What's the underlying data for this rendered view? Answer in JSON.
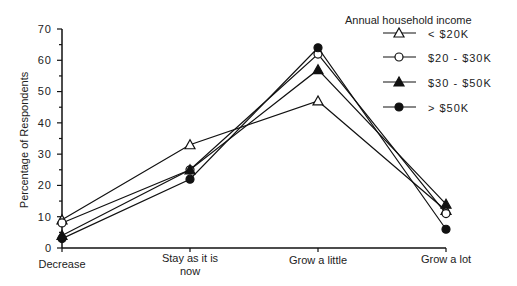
{
  "chart_data": {
    "type": "line",
    "title": "",
    "xlabel": "",
    "ylabel": "Percentage of Respondents",
    "ylim": [
      0,
      70
    ],
    "yticks": [
      0,
      10,
      20,
      30,
      40,
      50,
      60,
      70
    ],
    "categories": [
      "Decrease",
      "Stay as it is now",
      "Grow a little",
      "Grow a lot"
    ],
    "legend_title": "Annual household income",
    "legend_position": "top-right",
    "grid": false,
    "series": [
      {
        "name": "< $20K",
        "marker": "open-triangle",
        "values": [
          9,
          33,
          47,
          12
        ]
      },
      {
        "name": "$20 - $30K",
        "marker": "open-circle",
        "values": [
          8,
          25,
          62,
          11
        ]
      },
      {
        "name": "$30 - $50K",
        "marker": "filled-triangle",
        "values": [
          4,
          25,
          57,
          14
        ]
      },
      {
        "name": "> $50K",
        "marker": "filled-circle",
        "values": [
          3,
          22,
          64,
          6
        ]
      }
    ]
  },
  "labels": {
    "ylabel": "Percentage of Respondents",
    "legend_title": "Annual household income",
    "cat0": "Decrease",
    "cat1a": "Stay as it is",
    "cat1b": "now",
    "cat2": "Grow a little",
    "cat3": "Grow a lot",
    "s0": "< $20K",
    "s1": "$20 - $30K",
    "s2": "$30 - $50K",
    "s3": "> $50K",
    "y0": "0",
    "y10": "10",
    "y20": "20",
    "y30": "30",
    "y40": "40",
    "y50": "50",
    "y60": "60",
    "y70": "70"
  }
}
